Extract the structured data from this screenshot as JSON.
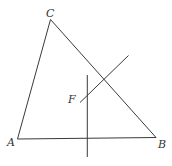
{
  "diagram": {
    "type": "geometry",
    "colors": {
      "line": "#3a3a3a",
      "label": "#333333",
      "background": "#ffffff"
    },
    "triangle": {
      "vertices": {
        "A": {
          "label": "A",
          "x": 17.5,
          "y": 139
        },
        "B": {
          "label": "B",
          "x": 156,
          "y": 137.5
        },
        "C": {
          "label": "C",
          "x": 50.5,
          "y": 19.5
        }
      }
    },
    "lines": [
      {
        "name": "vertical-line",
        "x1": 87.3,
        "y1": 75,
        "x2": 87.3,
        "y2": 157
      },
      {
        "name": "diagonal-line",
        "x1": 80,
        "y1": 102.5,
        "x2": 128.5,
        "y2": 55.5
      }
    ],
    "labels": [
      {
        "name": "label-C",
        "text": "C",
        "x": 46,
        "y": 17
      },
      {
        "name": "label-A",
        "text": "A",
        "x": 7,
        "y": 146
      },
      {
        "name": "label-B",
        "text": "B",
        "x": 158,
        "y": 148
      },
      {
        "name": "label-F",
        "text": "F",
        "x": 68,
        "y": 103
      }
    ]
  }
}
